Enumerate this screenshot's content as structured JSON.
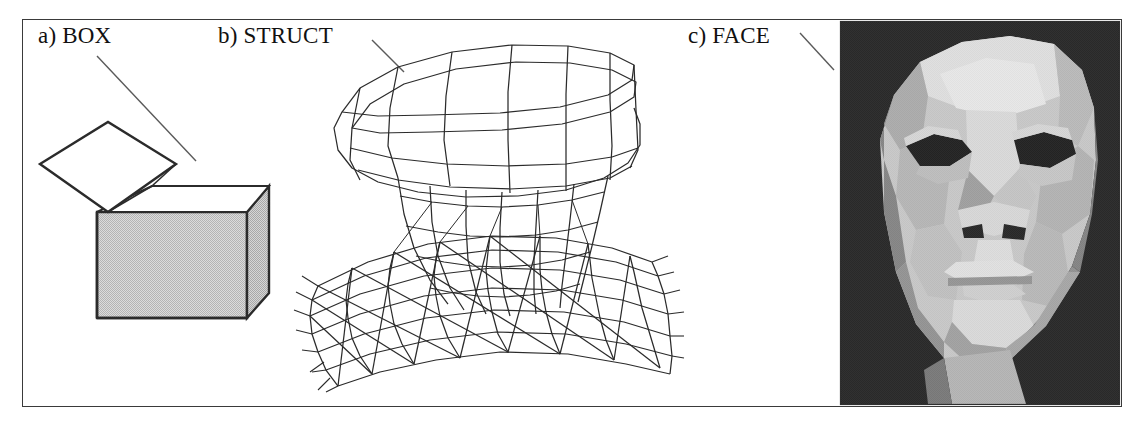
{
  "figure": {
    "background_color": "#ffffff",
    "frame_color": "#3a3a3a",
    "panels": [
      {
        "id": "box",
        "label": "a) BOX",
        "caption_letter": "a)",
        "name": "BOX"
      },
      {
        "id": "struct",
        "label": "b) STRUCT",
        "caption_letter": "b)",
        "name": "STRUCT"
      },
      {
        "id": "face",
        "label": "c) FACE",
        "caption_letter": "c)",
        "name": "FACE"
      }
    ]
  },
  "labels": {
    "box": "a) BOX",
    "struct": "b) STRUCT",
    "face": "c) FACE"
  },
  "colors": {
    "line": "#2b2b2b",
    "box_fill_shaded": "#d2d2d2",
    "box_fill_light": "#ffffff",
    "leader_line": "#555555",
    "face_background": "#0d0d0d",
    "face_highlight": "#e6e6e6",
    "face_midtone": "#bdbdbd",
    "face_shadow": "#8a8a8a",
    "face_dark": "#5c5c5c",
    "eye_socket": "#0a0a0a"
  },
  "geometry": {
    "frame": {
      "x": 22,
      "y": 19,
      "width": 1100,
      "height": 388
    },
    "leader_lines": [
      {
        "panel": "box",
        "x1": 97,
        "y1": 56,
        "x2": 196,
        "y2": 161
      },
      {
        "panel": "struct",
        "x1": 372,
        "y1": 40,
        "x2": 404,
        "y2": 72
      },
      {
        "panel": "face",
        "x1": 800,
        "y1": 33,
        "x2": 834,
        "y2": 70
      }
    ],
    "box": {
      "front_face": [
        [
          97,
          212
        ],
        [
          97,
          318
        ],
        [
          247,
          318
        ],
        [
          247,
          212
        ]
      ],
      "right_face": [
        [
          247,
          212
        ],
        [
          269,
          186
        ],
        [
          269,
          293
        ],
        [
          247,
          318
        ]
      ],
      "top_opening": [
        [
          97,
          212
        ],
        [
          152,
          186
        ],
        [
          269,
          186
        ],
        [
          247,
          212
        ]
      ],
      "lid": [
        [
          40,
          164
        ],
        [
          108,
          122
        ],
        [
          176,
          164
        ],
        [
          108,
          212
        ]
      ]
    },
    "face_panel": {
      "x": 840,
      "y": 21,
      "width": 280,
      "height": 384
    }
  },
  "scene_description": {
    "box": "Open cardboard box drawn in line art with shaded grey front and right faces and an open hinged lid",
    "struct": "3D wireframe quadrilateral mesh of an anvil / mushroom shaped surface over a rippled base plane",
    "face": "Greyscale flat-shaded low polygon rendering of a human head, front view, black background"
  }
}
